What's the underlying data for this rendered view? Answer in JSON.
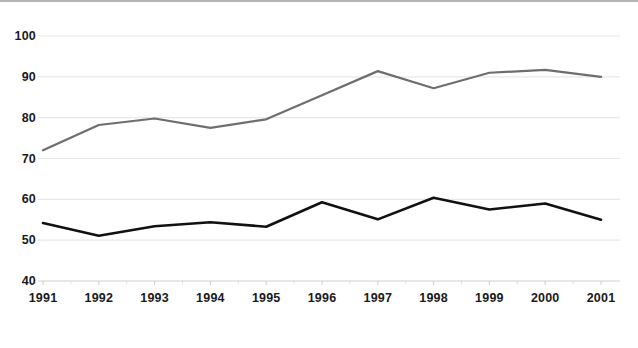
{
  "chart_data": {
    "type": "line",
    "title": "",
    "subtitle": "",
    "xlabel": "",
    "ylabel": "",
    "x": [
      1991,
      1992,
      1993,
      1994,
      1995,
      1996,
      1997,
      1998,
      1999,
      2000,
      2001
    ],
    "categories": [
      "1991",
      "1992",
      "1993",
      "1994",
      "1995",
      "1996",
      "1997",
      "1998",
      "1999",
      "2000",
      "2001"
    ],
    "series": [
      {
        "name": "upper-series",
        "color": "#6e6e6e",
        "values": [
          72.0,
          78.2,
          79.8,
          77.5,
          79.6,
          85.5,
          91.4,
          87.2,
          91.0,
          91.7,
          90.0
        ]
      },
      {
        "name": "lower-series",
        "color": "#111111",
        "values": [
          54.2,
          51.1,
          53.4,
          54.4,
          53.3,
          59.3,
          55.1,
          60.4,
          57.5,
          59.0,
          55.0
        ]
      }
    ],
    "ylim": [
      40,
      100
    ],
    "yticks": [
      40,
      50,
      60,
      70,
      80,
      90,
      100
    ],
    "ytick_labels": [
      "40",
      "50",
      "60",
      "70",
      "80",
      "90",
      "100"
    ],
    "xtick_labels": [
      "1991",
      "1992",
      "1993",
      "1994",
      "1995",
      "1996",
      "1997",
      "1998",
      "1999",
      "2000",
      "2001"
    ],
    "grid": true,
    "grid_color": "#e8e8e8",
    "axis_color": "#d0d0d0",
    "legend": "none",
    "background": "#ffffff"
  }
}
